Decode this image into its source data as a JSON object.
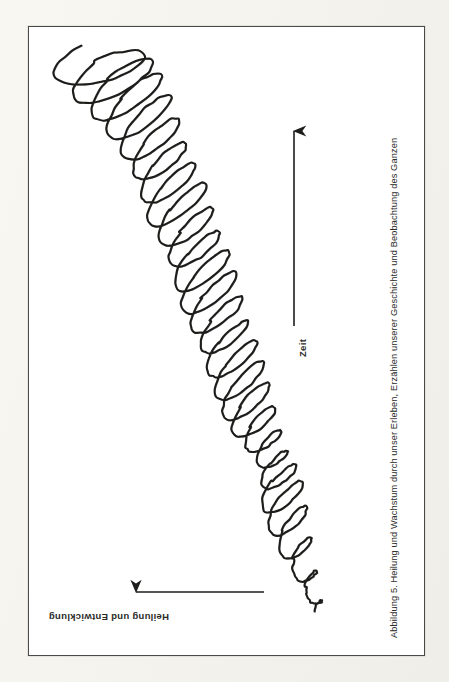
{
  "figure": {
    "caption": "Abbildung 5. Heilung und Wachstum durch unser Erleben, Erzählen unserer Geschichte und Beobachtung des Ganzen",
    "caption_orientation": "rotated-90-ccw-right-edge",
    "background_color": "#ffffff",
    "page_color": "#f7f6f1",
    "ink_color": "#1d1d1b",
    "border_color": "#4a4a46"
  },
  "axes": {
    "vertical": {
      "label": "Zeit",
      "direction": "up",
      "arrow_from": [
        293,
        325
      ],
      "arrow_to": [
        293,
        125
      ]
    },
    "horizontal": {
      "label": "Heilung und Entwicklung",
      "direction": "left",
      "label_orientation": "rotated-180",
      "arrow_from": [
        263,
        591
      ],
      "arrow_to": [
        133,
        591
      ]
    }
  },
  "chart_data": {
    "type": "line",
    "title": "Abbildung 5. Heilung und Wachstum durch unser Erleben, Erzählen unserer Geschichte und Beobachtung des Ganzen",
    "xlabel": "Heilung und Entwicklung",
    "ylabel": "Zeit",
    "grid": false,
    "legend": null,
    "spiral": {
      "turns": 26,
      "start": [
        320,
        615
      ],
      "end": [
        103,
        70
      ],
      "axis_points": [
        [
          318,
          612
        ],
        [
          310,
          588
        ],
        [
          300,
          560
        ],
        [
          291,
          532
        ],
        [
          284,
          506
        ],
        [
          280,
          484
        ],
        [
          276,
          466
        ],
        [
          268,
          448
        ],
        [
          258,
          430
        ],
        [
          249,
          410
        ],
        [
          242,
          390
        ],
        [
          236,
          368
        ],
        [
          228,
          346
        ],
        [
          220,
          324
        ],
        [
          212,
          302
        ],
        [
          205,
          280
        ],
        [
          198,
          258
        ],
        [
          190,
          236
        ],
        [
          181,
          214
        ],
        [
          172,
          192
        ],
        [
          164,
          170
        ],
        [
          155,
          148
        ],
        [
          145,
          126
        ],
        [
          133,
          104
        ],
        [
          120,
          86
        ],
        [
          106,
          72
        ]
      ],
      "loop_half_widths": [
        7,
        13,
        20,
        25,
        27,
        22,
        17,
        20,
        26,
        30,
        32,
        31,
        29,
        32,
        35,
        34,
        31,
        33,
        36,
        34,
        32,
        35,
        38,
        40,
        42,
        44
      ],
      "loop_half_heights": [
        5,
        7,
        9,
        10,
        10,
        8,
        7,
        8,
        10,
        11,
        11,
        11,
        10,
        11,
        12,
        12,
        11,
        12,
        12,
        12,
        12,
        13,
        13,
        14,
        15,
        16
      ],
      "tilt_degrees": [
        -58,
        -56,
        -54,
        -52,
        -48,
        -44,
        -42,
        -44,
        -46,
        -48,
        -48,
        -46,
        -44,
        -44,
        -45,
        -45,
        -44,
        -44,
        -45,
        -45,
        -44,
        -44,
        -43,
        -40,
        -32,
        -18
      ]
    }
  }
}
